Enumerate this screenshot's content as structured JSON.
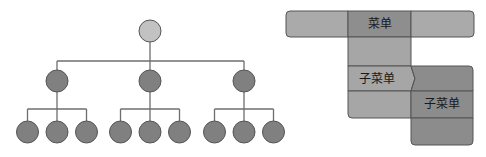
{
  "tree": {
    "description": "hierarchical tree: 1 root, 3 children, each with 3 leaves",
    "root": {
      "id": "root",
      "color": "#c2c2c2",
      "children": [
        {
          "id": "child-1",
          "children": [
            {
              "id": "leaf-1-1"
            },
            {
              "id": "leaf-1-2"
            },
            {
              "id": "leaf-1-3"
            }
          ]
        },
        {
          "id": "child-2",
          "children": [
            {
              "id": "leaf-2-1"
            },
            {
              "id": "leaf-2-2"
            },
            {
              "id": "leaf-2-3"
            }
          ]
        },
        {
          "id": "child-3",
          "children": [
            {
              "id": "leaf-3-1"
            },
            {
              "id": "leaf-3-2"
            },
            {
              "id": "leaf-3-3"
            }
          ]
        }
      ]
    },
    "node_color": "#808080",
    "line_color": "#6e6e6e"
  },
  "menu": {
    "top_bar": {
      "items": [
        {
          "label": "",
          "color": "#aaaaaa"
        },
        {
          "label": "菜单",
          "color": "#8e8e8e"
        },
        {
          "label": "",
          "color": "#aaaaaa"
        }
      ]
    },
    "dropdown": {
      "color": "#a6a6a6",
      "items": [
        {
          "label": ""
        },
        {
          "label": "子菜单",
          "has_submenu": true
        },
        {
          "label": ""
        }
      ]
    },
    "submenu": {
      "color": "#8c8c8c",
      "items": [
        {
          "label": ""
        },
        {
          "label": "子菜单"
        },
        {
          "label": ""
        }
      ]
    },
    "border_color": "#555555"
  }
}
